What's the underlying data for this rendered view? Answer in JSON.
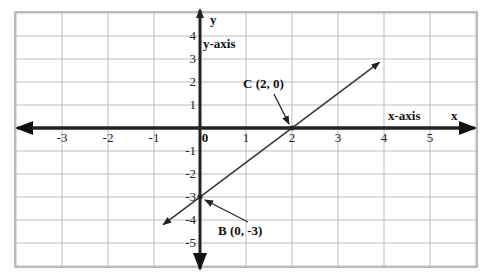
{
  "chart_data": {
    "type": "line",
    "title": "",
    "xlabel": "x",
    "ylabel": "y",
    "x_axis_label": "x-axis",
    "y_axis_label": "y-axis",
    "xlim": [
      -4,
      6
    ],
    "ylim": [
      -6,
      5
    ],
    "grid": true,
    "x_ticks": [
      "-3",
      "-2",
      "-1",
      "0",
      "1",
      "2",
      "3",
      "4",
      "5"
    ],
    "x_tick_values": [
      -3,
      -2,
      -1,
      0,
      1,
      2,
      3,
      4,
      5
    ],
    "y_ticks": [
      "4",
      "3",
      "2",
      "1",
      "-1",
      "-2",
      "-3",
      "-4",
      "-5"
    ],
    "y_tick_values": [
      4,
      3,
      2,
      1,
      -1,
      -2,
      -3,
      -4,
      -5
    ],
    "line": {
      "equation": "y = 1.5x - 3",
      "slope": 1.5,
      "intercept": -3,
      "x_range": [
        -0.8,
        3.9
      ]
    },
    "points": [
      {
        "label": "C (2, 0)",
        "x": 2,
        "y": 0
      },
      {
        "label": "B (0, -3)",
        "x": 0,
        "y": -3
      }
    ]
  }
}
